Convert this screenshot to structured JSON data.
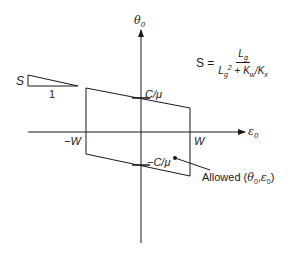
{
  "diagram": {
    "type": "parameter-space region",
    "axes": {
      "vertical": {
        "label": "θ0",
        "symbol": "θ",
        "subscript": "0"
      },
      "horizontal": {
        "label": "ε0",
        "symbol": "ε",
        "subscript": "0"
      }
    },
    "formula": {
      "lhs": "S =",
      "numerator": {
        "base": "L",
        "sub": "g"
      },
      "denominator": {
        "base": "L",
        "sub": "g",
        "sup": "2",
        "plus": "+",
        "term": "K",
        "term_sub": "w",
        "slash": "/",
        "term2": "K",
        "term2_sub": "x"
      },
      "text": "S = Lg / (Lg² + Kw/Kx)"
    },
    "slope_triangle": {
      "rise_label": "S",
      "run_label": "1"
    },
    "labels": {
      "top_intercept": "C/μ",
      "bottom_intercept": "−C/μ",
      "left_bound": "−W",
      "right_bound": "W",
      "region": "Allowed (θ0,ε0)",
      "region_prefix": "Allowed (",
      "region_theta": "θ",
      "region_sub0": "0",
      "region_comma": ",",
      "region_eps": "ε",
      "region_sub1": "0",
      "region_suffix": ")"
    },
    "colors": {
      "ink": "#1a1a1a",
      "background": "#ffffff"
    }
  }
}
